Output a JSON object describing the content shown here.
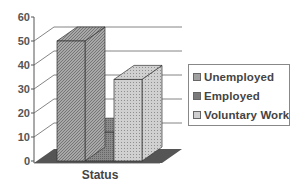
{
  "chart_data": {
    "type": "bar",
    "style": "3d-column",
    "title": "",
    "xlabel": "Status",
    "ylabel": "",
    "categories": [
      "Status"
    ],
    "series": [
      {
        "name": "Unemployed",
        "values": [
          50
        ],
        "color": "#9a9a9a",
        "pattern": "diagonal-hatch"
      },
      {
        "name": "Employed",
        "values": [
          12
        ],
        "color": "#7f7f7f",
        "pattern": "dense-hatch"
      },
      {
        "name": "Voluntary Work",
        "values": [
          34
        ],
        "color": "#c4c4c4",
        "pattern": "dots"
      }
    ],
    "ylim": [
      0,
      60
    ],
    "yticks": [
      0,
      10,
      20,
      30,
      40,
      50,
      60
    ],
    "grid": true,
    "legend_position": "right"
  },
  "legend": {
    "items": [
      {
        "label": "Unemployed"
      },
      {
        "label": "Employed"
      },
      {
        "label": "Voluntary Work"
      }
    ]
  }
}
